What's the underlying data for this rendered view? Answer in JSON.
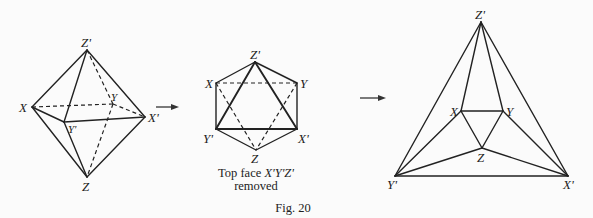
{
  "figure": {
    "number_label": "Fig. 20",
    "panels": [
      {
        "id": "octahedron",
        "description": "Octahedron in perspective",
        "vertices": {
          "Z_prime": {
            "label": "Z'",
            "x": 87,
            "y": 50
          },
          "X": {
            "label": "X",
            "x": 32,
            "y": 107
          },
          "X_prime": {
            "label": "X'",
            "x": 145,
            "y": 117
          },
          "Y": {
            "label": "Y",
            "x": 113,
            "y": 104
          },
          "Y_prime": {
            "label": "Y'",
            "x": 64,
            "y": 122
          },
          "Z": {
            "label": "Z",
            "x": 87,
            "y": 177
          }
        }
      },
      {
        "id": "hexagon-view",
        "description": "Octahedron viewed along axis",
        "vertices": {
          "Z_prime": {
            "label": "Z'",
            "x": 255,
            "y": 62
          },
          "X": {
            "label": "X",
            "x": 216,
            "y": 83
          },
          "Y": {
            "label": "Y",
            "x": 297,
            "y": 83
          },
          "Y_prime": {
            "label": "Y'",
            "x": 216,
            "y": 129
          },
          "X_prime": {
            "label": "X'",
            "x": 297,
            "y": 129
          },
          "Z": {
            "label": "Z",
            "x": 256,
            "y": 150
          }
        },
        "caption_line1_prefix": "Top face ",
        "caption_line1_italic": "X'Y'Z'",
        "caption_line2": "removed"
      },
      {
        "id": "schlegel-diagram",
        "description": "Flattened planar graph",
        "vertices": {
          "Z_prime": {
            "label": "Z'",
            "x": 481,
            "y": 22
          },
          "X": {
            "label": "X",
            "x": 461,
            "y": 111
          },
          "Y": {
            "label": "Y",
            "x": 503,
            "y": 111
          },
          "Z": {
            "label": "Z",
            "x": 482,
            "y": 148
          },
          "Y_prime": {
            "label": "Y'",
            "x": 395,
            "y": 176
          },
          "X_prime": {
            "label": "X'",
            "x": 568,
            "y": 176
          }
        }
      }
    ],
    "arrows": [
      {
        "id": "arrow-1",
        "from_x": 156,
        "to_x": 178,
        "y": 107
      },
      {
        "id": "arrow-2",
        "from_x": 360,
        "to_x": 386,
        "y": 98
      }
    ]
  }
}
